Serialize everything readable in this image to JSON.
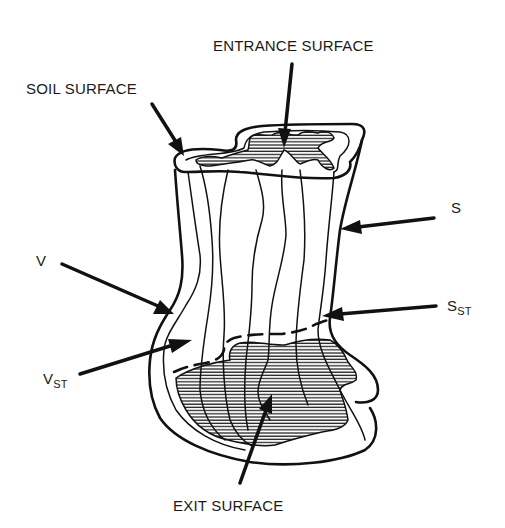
{
  "figure": {
    "type": "stream-tube schematic",
    "colors": {
      "line": "#111111",
      "hatch": "#111111",
      "background": "#ffffff"
    }
  },
  "labels": {
    "entrance_surface": "ENTRANCE SURFACE",
    "soil_surface": "SOIL SURFACE",
    "s": "S",
    "v": "V",
    "s_st_main": "S",
    "s_st_sub": "ST",
    "v_st_main": "V",
    "v_st_sub": "ST",
    "exit_surface": "EXIT SURFACE"
  }
}
